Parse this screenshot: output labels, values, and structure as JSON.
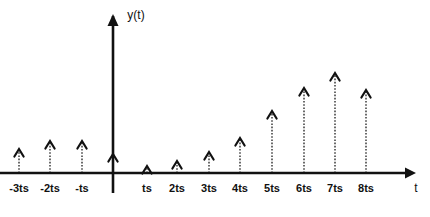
{
  "figure": {
    "y_axis_label": "y(t)",
    "x_axis_label": "t"
  },
  "chart_data": {
    "type": "bar",
    "title": "",
    "subtitle": "",
    "xlabel": "t",
    "ylabel": "y(t)",
    "grid": false,
    "legend": null,
    "categories": [
      "-3ts",
      "-2ts",
      "-ts",
      "0",
      "ts",
      "2ts",
      "3ts",
      "4ts",
      "5ts",
      "6ts",
      "7ts",
      "8ts"
    ],
    "tick_labels": [
      "-3ts",
      "-2ts",
      "-ts",
      "ts",
      "2ts",
      "3ts",
      "4ts",
      "5ts",
      "6ts",
      "7ts",
      "8ts"
    ],
    "values": [
      0.25,
      0.33,
      0.33,
      0.19,
      0.08,
      0.13,
      0.21,
      0.36,
      0.63,
      0.88,
      1.0,
      0.85
    ],
    "x": [
      -3,
      -2,
      -1,
      0,
      1,
      2,
      3,
      4,
      5,
      6,
      7,
      8
    ],
    "xlim": [
      -3.6,
      9.6
    ],
    "ylim": [
      0,
      1.05
    ],
    "units": "ts",
    "marker": "up-arrow"
  },
  "ticks": [
    {
      "label": "-3ts",
      "x": 19,
      "tip_y": 149,
      "has_stem": true
    },
    {
      "label": "-2ts",
      "x": 50,
      "tip_y": 141,
      "has_stem": true
    },
    {
      "label": "-ts",
      "x": 82,
      "tip_y": 141,
      "has_stem": true
    },
    {
      "label": "",
      "x": 113,
      "tip_y": 154,
      "has_stem": true
    },
    {
      "label": "ts",
      "x": 147,
      "tip_y": 166,
      "has_stem": true
    },
    {
      "label": "2ts",
      "x": 177,
      "tip_y": 161,
      "has_stem": true
    },
    {
      "label": "3ts",
      "x": 209,
      "tip_y": 152,
      "has_stem": true
    },
    {
      "label": "4ts",
      "x": 240,
      "tip_y": 138,
      "has_stem": true
    },
    {
      "label": "5ts",
      "x": 272,
      "tip_y": 111,
      "has_stem": true
    },
    {
      "label": "6ts",
      "x": 304,
      "tip_y": 88,
      "has_stem": true
    },
    {
      "label": "7ts",
      "x": 335,
      "tip_y": 73,
      "has_stem": true
    },
    {
      "label": "8ts",
      "x": 366,
      "tip_y": 90,
      "has_stem": true
    }
  ],
  "geometry": {
    "baseline_y": 173,
    "label_y": 192,
    "y_axis_x": 113,
    "y_axis_top": 16,
    "y_axis_bottom": 193,
    "x_axis_left": 0,
    "x_axis_right": 406,
    "x_axis_label_x": 416,
    "y_axis_label_x": 136,
    "y_axis_label_y": 19
  },
  "colors": {
    "background": "#ffffff",
    "axis": "#111111",
    "stem": "#3a3a3a",
    "text": "#111111"
  }
}
